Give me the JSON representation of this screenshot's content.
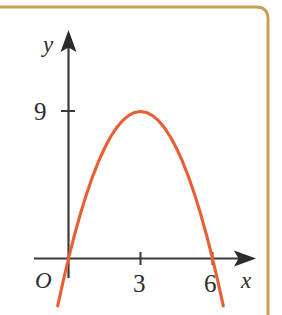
{
  "figure": {
    "background_color": "#ffffff",
    "border": {
      "name": "page-border-frame",
      "color": "#c9a052",
      "style": "rounded-corner-rule",
      "thickness": 3
    }
  },
  "chart_data": {
    "type": "line",
    "title": "",
    "subtitle": "",
    "xlabel": "x",
    "ylabel": "y",
    "origin_label": "O",
    "curve_color": "#e85f34",
    "axis_color": "#3a3a3a",
    "grid": false,
    "legend": null,
    "xlim": [
      -0.6,
      8.2
    ],
    "ylim": [
      -2.6,
      12.8
    ],
    "x_ticks": [
      3,
      6
    ],
    "x_tick_labels": [
      "3",
      "6"
    ],
    "y_ticks": [
      9
    ],
    "y_tick_labels": [
      "9"
    ],
    "roots": [
      0,
      6
    ],
    "vertex": [
      3,
      9
    ],
    "equation": "y = -x^2 + 6x",
    "x": [
      -0.45,
      -0.2,
      0,
      0.25,
      0.5,
      0.75,
      1,
      1.25,
      1.5,
      1.75,
      2,
      2.25,
      2.5,
      2.75,
      3,
      3.25,
      3.5,
      3.75,
      4,
      4.25,
      4.5,
      4.75,
      5,
      5.25,
      5.5,
      5.75,
      6,
      6.2,
      6.45
    ],
    "y": [
      -2.9,
      -1.24,
      0,
      1.44,
      2.75,
      3.94,
      5,
      5.94,
      6.75,
      7.44,
      8,
      8.44,
      8.75,
      8.94,
      9,
      8.94,
      8.75,
      8.44,
      8,
      7.44,
      6.75,
      5.94,
      5,
      3.94,
      2.75,
      1.44,
      0,
      -1.24,
      -2.9
    ],
    "annotations": []
  }
}
